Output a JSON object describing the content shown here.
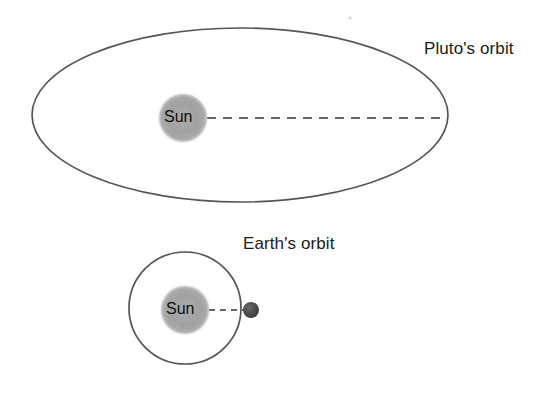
{
  "diagram": {
    "background_color": "#ffffff",
    "orbit_line_color": "#555555",
    "dashed_line_color": "#333333",
    "sun_color": "#a8a8a8",
    "earth_color": "#4a4a4a",
    "text_color": "#1a1a1a"
  },
  "pluto_system": {
    "orbit_label": "Pluto's orbit",
    "sun_label": "Sun",
    "orbit_shape": "ellipse",
    "orbit_center_x": 240,
    "orbit_center_y": 115,
    "orbit_radius_x": 208,
    "orbit_radius_y": 87,
    "sun_center_x": 183,
    "sun_center_y": 118,
    "sun_radius": 24,
    "radius_line_start_x": 207,
    "radius_line_end_x": 447,
    "radius_line_y": 118
  },
  "earth_system": {
    "orbit_label": "Earth's orbit",
    "sun_label": "Sun",
    "orbit_shape": "circle",
    "orbit_center_x": 185,
    "orbit_center_y": 308,
    "orbit_radius": 56,
    "sun_center_x": 185,
    "sun_center_y": 310,
    "sun_radius": 24,
    "planet_center_x": 251,
    "planet_center_y": 310,
    "planet_radius": 8,
    "radius_line_start_x": 209,
    "radius_line_end_x": 245,
    "radius_line_y": 310
  }
}
